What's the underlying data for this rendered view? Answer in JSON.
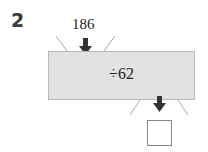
{
  "question": {
    "number": "2"
  },
  "machine": {
    "input": "186",
    "operation": "÷62",
    "output": ""
  },
  "colors": {
    "machine_fill": "#e2e2e2",
    "arrow": "#333333",
    "lines": "#aaaaaa"
  }
}
